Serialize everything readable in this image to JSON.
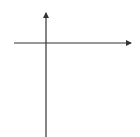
{
  "problem": {
    "number": "7."
  },
  "chart_data": {
    "type": "line",
    "title": "",
    "xlabel": "x",
    "ylabel": "y",
    "x_tick_labels": [
      "2",
      "4"
    ],
    "y_tick_labels": [
      "-8",
      "-16"
    ],
    "x_ticks": [
      2,
      4
    ],
    "y_ticks": [
      -8,
      -16
    ],
    "xlim": [
      -2.3,
      5.8
    ],
    "ylim": [
      -25,
      8
    ],
    "grid": true,
    "legend": null,
    "series": [
      {
        "name": "curve",
        "x": [
          0,
          0.25,
          0.5,
          0.75,
          1.0,
          1.25,
          1.5,
          1.75,
          1.8
        ],
        "y": [
          -1,
          -1.6,
          -2.7,
          -4.3,
          -6.6,
          -10,
          -14.5,
          -20.5,
          -22.5
        ],
        "arrow_end": true,
        "color": "#1a1a1a"
      }
    ]
  },
  "colors": {
    "grid": "#cfcfcf",
    "axis": "#333333",
    "curve": "#1a1a1a"
  }
}
